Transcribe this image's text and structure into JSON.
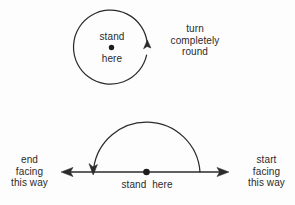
{
  "figure": {
    "background_color": "#fdfdfd",
    "stroke_color": "#2b2b2b",
    "text_color": "#2b2b2b"
  },
  "top_diagram": {
    "name": "full-turn-circle",
    "stand_line1": "stand",
    "stand_line2": "here",
    "instruction": "turn\ncompletely\nround",
    "instruction_lines": [
      "turn",
      "completely",
      "round"
    ],
    "arrow_direction": "counter-clockwise-upward",
    "circle": {
      "cx": 111.5,
      "cy": 48,
      "r": 37
    },
    "person_dot": {
      "cx": 111.5,
      "cy": 47,
      "r": 2.6
    }
  },
  "bottom_diagram": {
    "name": "half-turn-line",
    "left_label": "end\nfacing\nthis way",
    "left_label_lines": [
      "end",
      "facing",
      "this way"
    ],
    "right_label": "start\nfacing\nthis way",
    "right_label_lines": [
      "start",
      "facing",
      "this way"
    ],
    "center_label": "stand  here",
    "axis": {
      "y": 172,
      "x_start": 62,
      "x_end": 228
    },
    "arc": {
      "cx": 146.5,
      "cy": 172,
      "r": 53.5
    },
    "person_dot": {
      "cx": 146.5,
      "cy": 172,
      "r": 3.2
    }
  }
}
